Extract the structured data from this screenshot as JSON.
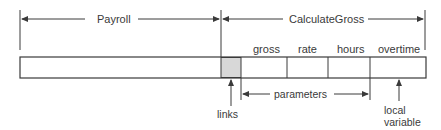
{
  "diagram": {
    "spans": {
      "payroll": "Payroll",
      "calculate_gross": "CalculateGross"
    },
    "cells": {
      "links": "",
      "gross": "gross",
      "rate": "rate",
      "hours": "hours",
      "overtime": "overtime"
    },
    "annotations": {
      "links": "links",
      "parameters": "parameters",
      "local_variable_line1": "local",
      "local_variable_line2": "variable"
    },
    "colors": {
      "line": "#3a3a3a",
      "links_fill": "#d8d8d8",
      "background": "#ffffff"
    }
  }
}
